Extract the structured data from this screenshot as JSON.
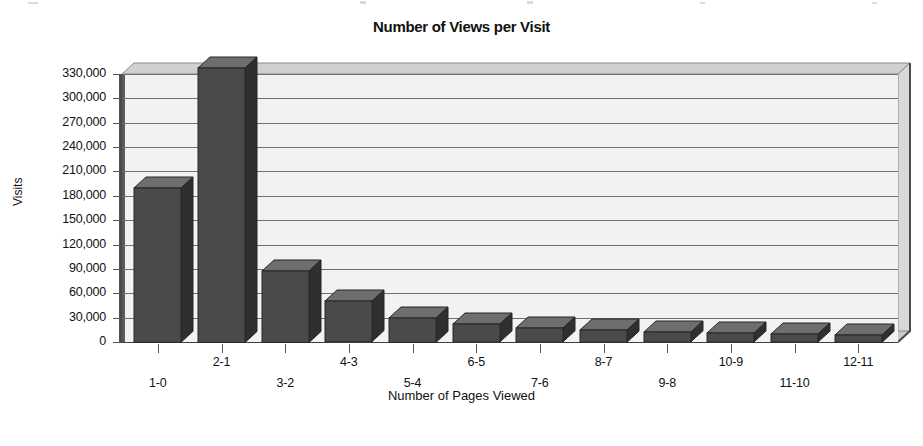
{
  "chart_data": {
    "type": "bar",
    "title": "Number of Views per Visit",
    "xlabel": "Number of Pages Viewed",
    "ylabel": "Visits",
    "categories": [
      "1-0",
      "2-1",
      "3-2",
      "4-3",
      "5-4",
      "6-5",
      "7-6",
      "8-7",
      "9-8",
      "10-9",
      "11-10",
      "12-11"
    ],
    "values": [
      190000,
      338000,
      88000,
      50000,
      30000,
      22000,
      17000,
      15000,
      12000,
      11000,
      10000,
      9000
    ],
    "ylim": [
      0,
      345000
    ],
    "ytick_values": [
      0,
      30000,
      60000,
      90000,
      120000,
      150000,
      180000,
      210000,
      240000,
      270000,
      300000,
      330000
    ],
    "ytick_labels": [
      "0",
      "30,000",
      "60,000",
      "90,000",
      "120,000",
      "150,000",
      "180,000",
      "210,000",
      "240,000",
      "270,000",
      "300,000",
      "330,000"
    ],
    "grid": true,
    "legend": false,
    "series_name": "Visits",
    "style": "3d-bar",
    "colors": {
      "bar_front": "#4a4a4a",
      "bar_top": "#6e6e6e",
      "bar_side": "#2f2f2f",
      "plot_background": "#f2f2f0",
      "gridline": "#6f6f6f",
      "axis": "#4a4a4a",
      "text": "#111111",
      "page_background": "#ffffff"
    }
  }
}
